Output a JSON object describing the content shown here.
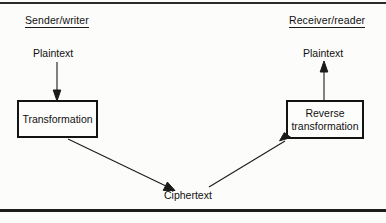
{
  "figure": {
    "type": "flow-diagram",
    "headings": {
      "sender": "Sender/writer",
      "receiver": "Receiver/reader"
    },
    "nodes": {
      "plaintext_left": "Plaintext",
      "plaintext_right": "Plaintext",
      "ciphertext": "Ciphertext",
      "transformation": "Transformation",
      "reverse_transformation": "Reverse\ntransformation",
      "reverse_transformation_line1": "Reverse",
      "reverse_transformation_line2": "transformation"
    },
    "colors": {
      "ink": "#111111",
      "rule": "#1d1d1d",
      "box_border": "#131313",
      "background": "#fcfcfb"
    }
  }
}
